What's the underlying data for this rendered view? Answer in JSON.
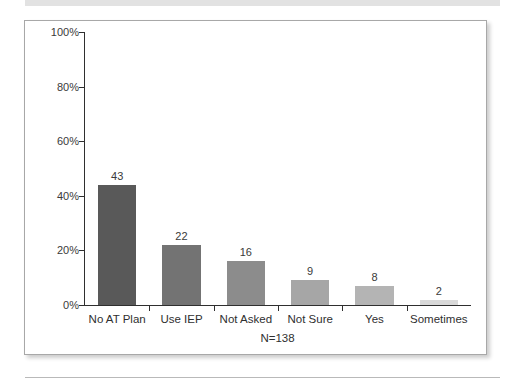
{
  "decorations": {
    "top_rule_color": "#e2e2e2",
    "bottom_rule_color": "#b9b9b9",
    "frame_border_color": "#a8a8a8",
    "axis_color": "#2f2f2f"
  },
  "chart_data": {
    "type": "bar",
    "title": "",
    "subtitle": "",
    "xlabel": "N=138",
    "ylabel": "",
    "categories": [
      "No AT Plan",
      "Use IEP",
      "Not Asked",
      "Not Sure",
      "Yes",
      "Sometimes"
    ],
    "values": [
      43,
      22,
      16,
      9,
      8,
      2
    ],
    "value_labels": [
      "43",
      "22",
      "16",
      "9",
      "8",
      "2"
    ],
    "percent_heights": [
      44,
      22,
      16,
      9,
      7,
      2
    ],
    "bar_colors": [
      "#595959",
      "#737373",
      "#8c8c8c",
      "#a6a6a6",
      "#b4b4b4",
      "#d9d9d9"
    ],
    "ylim": [
      0,
      100
    ],
    "yticks": [
      0,
      20,
      40,
      60,
      80,
      100
    ],
    "ytick_labels": [
      "0%",
      "20%",
      "40%",
      "60%",
      "80%",
      "100%"
    ],
    "grid": false,
    "legend": "none",
    "sample_size_note": "N=138"
  }
}
